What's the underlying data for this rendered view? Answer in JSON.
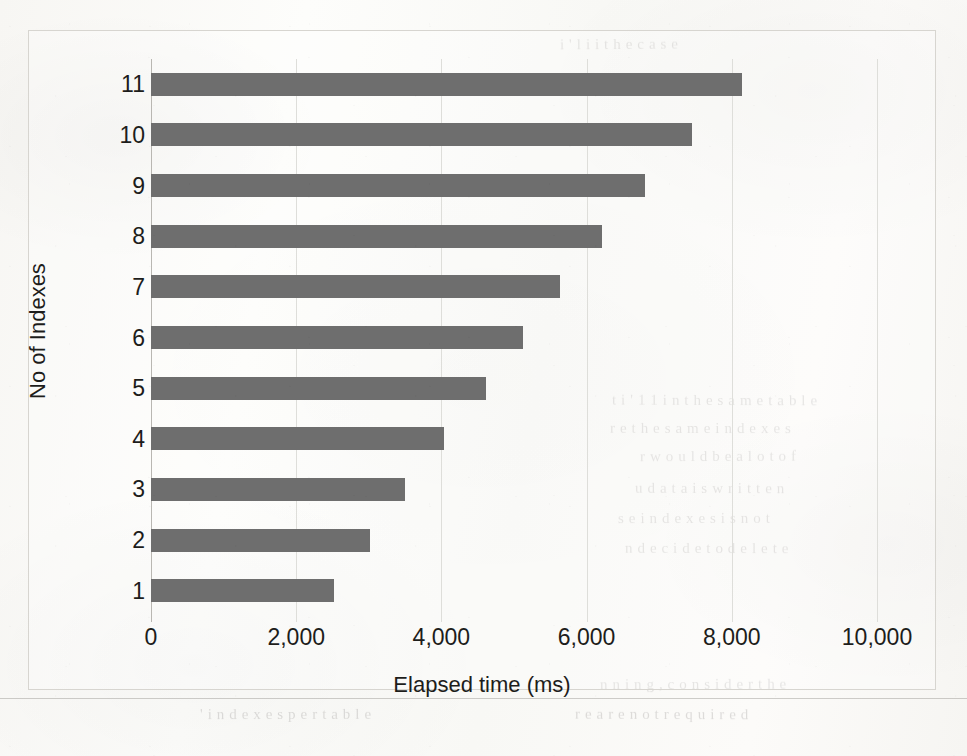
{
  "figure": {
    "background_color": "#fbfbf9",
    "bar_color": "#6e6e6e",
    "grid_color": "#dededa",
    "axis_color": "#b9b7b2",
    "text_color": "#1d1d1b"
  },
  "chart_data": {
    "type": "bar",
    "orientation": "horizontal",
    "title": "",
    "xlabel": "Elapsed time (ms)",
    "ylabel": "No of Indexes",
    "categories": [
      "1",
      "2",
      "3",
      "4",
      "5",
      "6",
      "7",
      "8",
      "9",
      "10",
      "11"
    ],
    "values": [
      2520,
      3010,
      3500,
      4040,
      4620,
      5120,
      5630,
      6210,
      6800,
      7450,
      8140
    ],
    "xlim": [
      0,
      10000
    ],
    "xticks": [
      0,
      2000,
      4000,
      6000,
      8000,
      10000
    ],
    "xticklabels": [
      "0",
      "2,000",
      "4,000",
      "6,000",
      "8,000",
      "10,000"
    ],
    "grid": "vertical-only",
    "legend": "none",
    "series": [
      {
        "name": "Elapsed time (ms)",
        "values": [
          2520,
          3010,
          3500,
          4040,
          4620,
          5120,
          5630,
          6210,
          6800,
          7450,
          8140
        ]
      }
    ]
  },
  "scan_artifacts": {
    "bleed_through": [
      {
        "text": "i  ' l i i   t h e   c a s e",
        "x": 560,
        "y": 36,
        "size": 15,
        "rotate": -0.4
      },
      {
        "text": "t  i ' 1 1   i n   t h e  s a m e  t a b l e",
        "x": 612,
        "y": 392,
        "size": 15,
        "rotate": 0.2
      },
      {
        "text": "r e  t h e   s a m e   i n d e x e s",
        "x": 610,
        "y": 420,
        "size": 15,
        "rotate": 0.1
      },
      {
        "text": "r   w o u l d   b e   a   l o t   o f",
        "x": 640,
        "y": 448,
        "size": 15,
        "rotate": -0.2
      },
      {
        "text": "u  d a t a   i s   w r i t t e n",
        "x": 635,
        "y": 480,
        "size": 15,
        "rotate": 0.2
      },
      {
        "text": "s e   i n d e x e s   i s   n o t",
        "x": 618,
        "y": 510,
        "size": 15,
        "rotate": -0.1
      },
      {
        "text": "n   d e c i d e   t o   d e l e t e",
        "x": 625,
        "y": 540,
        "size": 15,
        "rotate": 0.15
      },
      {
        "text": "n n i n g ,   c o n s i d e r   t h e",
        "x": 600,
        "y": 676,
        "size": 15,
        "rotate": -0.2
      },
      {
        "text": "r e   a r e   n o t   r e q u i r e d",
        "x": 575,
        "y": 706,
        "size": 15,
        "rotate": 0.2
      },
      {
        "text": "' i n d e x e s   p e r   t a b l e",
        "x": 200,
        "y": 706,
        "size": 15,
        "rotate": -0.1
      }
    ]
  }
}
